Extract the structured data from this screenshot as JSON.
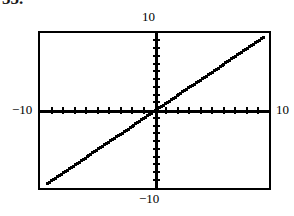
{
  "page": {
    "background_color": "#ffffff",
    "foreground_color": "#000000",
    "cropped_heading_fragment": "55."
  },
  "graph": {
    "frame": {
      "border_color": "#000000",
      "border_width_px": 2,
      "fill_color": "#ffffff"
    },
    "labels": {
      "top": "10",
      "bottom": "−10",
      "left": "−10",
      "right": "10"
    },
    "axis_names": {
      "horizontal": "x-axis",
      "vertical": "y-axis"
    }
  },
  "chart_data": {
    "type": "line",
    "title": "",
    "subtitle": "",
    "xlabel": "",
    "ylabel": "",
    "xlim": [
      -10,
      10
    ],
    "ylim": [
      -10,
      10
    ],
    "xticks": [
      -9,
      -8,
      -7,
      -6,
      -5,
      -4,
      -3,
      -2,
      -1,
      1,
      2,
      3,
      4,
      5,
      6,
      7,
      8,
      9
    ],
    "yticks": [
      -9,
      -8,
      -7,
      -6,
      -5,
      -4,
      -3,
      -2,
      -1,
      1,
      2,
      3,
      4,
      5,
      6,
      7,
      8,
      9
    ],
    "xtick_labels": [
      "−10",
      "10"
    ],
    "ytick_labels": [
      "−10",
      "10"
    ],
    "grid": false,
    "legend": null,
    "axis_style": "centered-crosshair-with-ticks",
    "line_style": "pixelated-dotted",
    "series": [
      {
        "name": "y = x",
        "slope": 1,
        "intercept": 0,
        "x": [
          -9.4,
          -8.4,
          -7.4,
          -6.4,
          -5.4,
          -4.4,
          -3.4,
          -2.4,
          -1.4,
          -0.4,
          0.6,
          1.6,
          2.6,
          3.6,
          4.6,
          5.6,
          6.6,
          7.6,
          8.6,
          9.4
        ],
        "values": [
          -9.4,
          -8.4,
          -7.4,
          -6.4,
          -5.4,
          -4.4,
          -3.4,
          -2.4,
          -1.4,
          -0.4,
          0.6,
          1.6,
          2.6,
          3.6,
          4.6,
          5.6,
          6.6,
          7.6,
          8.6,
          9.4
        ]
      }
    ],
    "annotations": []
  }
}
